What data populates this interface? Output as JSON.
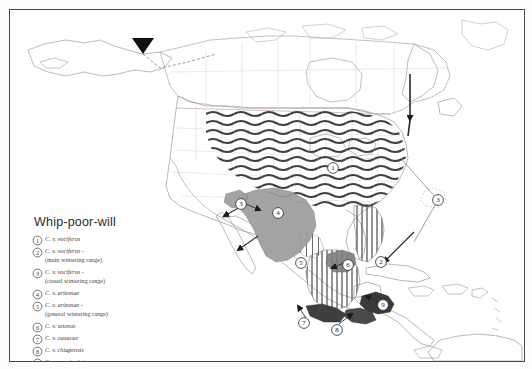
{
  "map": {
    "title": "Whip-poor-will",
    "region": "North America, Central America and the Caribbean",
    "legend_items": [
      {
        "num": "1",
        "name": "C. v. vociferus",
        "sub": ""
      },
      {
        "num": "2",
        "name": "C. v. vociferus -",
        "sub": "(main wintering range)"
      },
      {
        "num": "3",
        "name": "C. v. vociferus -",
        "sub": "(casual wintering range)"
      },
      {
        "num": "4",
        "name": "C. v. arizonae",
        "sub": ""
      },
      {
        "num": "5",
        "name": "C. v. arizonae -",
        "sub": "(general wintering range)"
      },
      {
        "num": "6",
        "name": "C. v. setosus",
        "sub": ""
      },
      {
        "num": "7",
        "name": "C. v. oaxacae",
        "sub": ""
      },
      {
        "num": "8",
        "name": "C. v. chiapensis",
        "sub": ""
      },
      {
        "num": "9",
        "name": "C. v. vermiculatus",
        "sub": ""
      }
    ],
    "vagrant_label": "vagrant",
    "markers": [
      {
        "id": "1",
        "label": "1",
        "x": 323,
        "y": 158
      },
      {
        "id": "2",
        "label": "2",
        "x": 371,
        "y": 252
      },
      {
        "id": "3",
        "label": "3",
        "x": 428,
        "y": 190
      },
      {
        "id": "4",
        "label": "4",
        "x": 268,
        "y": 203
      },
      {
        "id": "5",
        "label": "5",
        "x": 291,
        "y": 253
      },
      {
        "id": "6",
        "label": "6",
        "x": 338,
        "y": 255
      },
      {
        "id": "7",
        "label": "7",
        "x": 294,
        "y": 313
      },
      {
        "id": "8",
        "label": "8",
        "x": 327,
        "y": 320
      },
      {
        "id": "9",
        "label": "9",
        "x": 373,
        "y": 295
      },
      {
        "id": "3b",
        "label": "3",
        "x": 231,
        "y": 194
      }
    ],
    "colors": {
      "breeding_hatch": "#3b3b3b",
      "winter_gray": "#9a9a9a",
      "winter_dark": "#4e4e4e",
      "coast_line": "#8e8e8e",
      "border_line": "#b6b6b6",
      "frame": "#4a4a4a",
      "text": "#3b3b3b",
      "background": "#ffffff"
    }
  }
}
